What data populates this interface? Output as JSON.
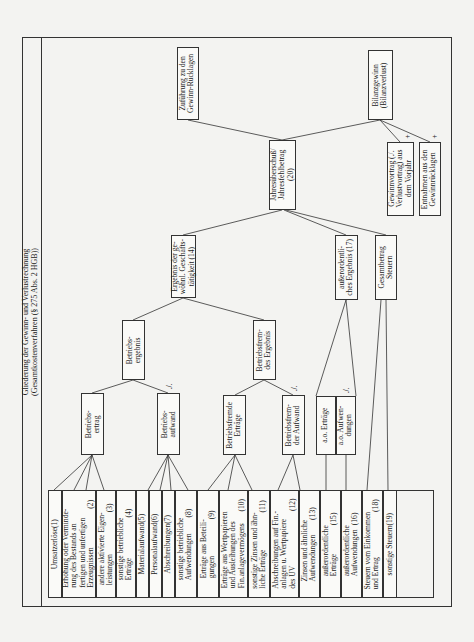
{
  "title": {
    "line1": "Gliederung der Gewinn- und Verlustrechnung",
    "line2": "(Gesamtkostenverfahren (§ 275 Abs. 2 HGB))"
  },
  "leaf_items": [
    {
      "label": "Umsatzerlöse",
      "num": "(1)"
    },
    {
      "label": "Erhöhung oder Verminde-\nrung des Bestands an\nfertigen und unfertigen\nErzeugnissen",
      "num": "(2)"
    },
    {
      "label": "andere aktivierte Eigen-\nleistungen",
      "num": "(3)"
    },
    {
      "label": "sonstige betriebliche\nErträge",
      "num": "(4)"
    },
    {
      "label": "Materialaufwand",
      "num": "(5)"
    },
    {
      "label": "Personalaufwand",
      "num": "(6)"
    },
    {
      "label": "Abschreibungen",
      "num": "(7)"
    },
    {
      "label": "sonstige betriebliche\nAufwendungen",
      "num": "(8)"
    },
    {
      "label": "Erträge aus Beteili-\ngungen",
      "num": "(9)"
    },
    {
      "label": "Erträge aus Wertpapieren\nund Ausleihungen des\nFin.anlagevermögens",
      "num": "(10)"
    },
    {
      "label": "sonstige Zinsen und ähn-\nliche Erträge",
      "num": "(11)"
    },
    {
      "label": "Abschreibungen auf Fin.-\nanlagen u. Wertpapiere\ndes UV",
      "num": "(12)"
    },
    {
      "label": "Zinsen und ähnliche\nAufwendungen",
      "num": "(13)"
    },
    {
      "label": "außerordentliche\nErträge",
      "num": "(15)"
    },
    {
      "label": "außerordentliche\nAufwendungen",
      "num": "(16)"
    },
    {
      "label": "Steuern vom Einkommen\nund Ertrag",
      "num": "(18)"
    },
    {
      "label": "sonstige Steuern",
      "num": "(19)"
    }
  ],
  "nodes": {
    "betriebsertrag": "Betriebs-\nertrag",
    "betriebsaufwand": "Betriebs-\naufwand",
    "betriebsergebnis": "Betriebs-\nergebnis",
    "ergebnis_gewoehnl": "Ergebnis der ge-\nwöhnl. Geschäfts-\ntätigkeit (14)",
    "betriebsfremde_ertraege": "Betriebsfremde\nErträge",
    "betriebsfremder_aufwand": "Betriebsfrem-\nder Aufwand",
    "betriebsfremdes_ergebnis": "Betriebsfrem-\ndes Ergebnis",
    "ao_ertraege": "a.o. Erträge",
    "ao_aufwendungen": "a.o. Aufwen-\ndungen",
    "ausserordentliches_ergebnis": "außerordentli-\nches Ergebnis (17)",
    "gesamtbetrag_steuern": "Gesamtbetrag\nSteuern",
    "jahresueberschuss": "Jahresüberschuß/\nJahresfehlbetrag\n(20)",
    "zufuehrung": "Zuführung zu den\nGewinn-Rücklagen",
    "bilanzgewinn": "Bilanzgewinn\n(Bilanzverlust)",
    "gewinnvortrag": "Gewinnvortrag (./.\nVerlustvortrag) aus\ndem Vorjahr",
    "entnahmen": "Entnahmen aus den\nGewinnrücklagen"
  },
  "marks": {
    "minus": "./.",
    "plus": "+"
  },
  "colors": {
    "line": "#333333",
    "background": "#f3f3f1",
    "box": "#fafaf8"
  }
}
